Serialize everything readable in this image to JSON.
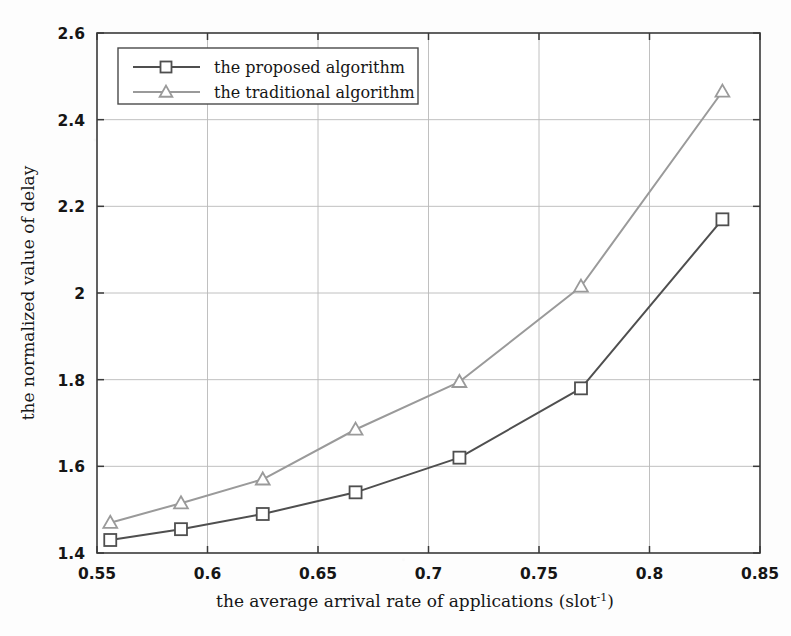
{
  "chart_data": {
    "type": "line",
    "title": "",
    "xlabel": "the average arrival rate of applications (slot⁻¹)",
    "xlabel_base": "the average arrival rate of applications (slot",
    "xlabel_exponent": "-1",
    "xlabel_tail": ")",
    "ylabel": "the normalized value of delay",
    "xlim": [
      0.55,
      0.85
    ],
    "ylim": [
      1.4,
      2.6
    ],
    "xticks": [
      0.55,
      0.6,
      0.65,
      0.7,
      0.75,
      0.8,
      0.85
    ],
    "xtick_labels": [
      "0.55",
      "0.6",
      "0.65",
      "0.7",
      "0.75",
      "0.8",
      "0.85"
    ],
    "yticks": [
      1.4,
      1.6,
      1.8,
      2.0,
      2.2,
      2.4,
      2.6
    ],
    "ytick_labels": [
      "1.4",
      "1.6",
      "1.8",
      "2",
      "2.2",
      "2.4",
      "2.6"
    ],
    "grid": true,
    "legend_position": "upper left",
    "x": [
      0.556,
      0.588,
      0.625,
      0.667,
      0.714,
      0.769,
      0.833
    ],
    "series": [
      {
        "name": "the proposed algorithm",
        "marker": "square",
        "color": "#4f4f4f",
        "values": [
          1.43,
          1.455,
          1.49,
          1.54,
          1.62,
          1.78,
          2.17
        ]
      },
      {
        "name": "the traditional algorithm",
        "marker": "triangle",
        "color": "#9a9a9a",
        "values": [
          1.47,
          1.515,
          1.57,
          1.685,
          1.795,
          2.015,
          2.465
        ]
      }
    ]
  },
  "legend": {
    "entries": [
      {
        "label": "the proposed algorithm",
        "marker": "square-marker",
        "color": "#4f4f4f"
      },
      {
        "label": "the traditional algorithm",
        "marker": "triangle-marker",
        "color": "#9a9a9a"
      }
    ]
  },
  "colors": {
    "proposed": "#4f4f4f",
    "traditional": "#9a9a9a",
    "grid": "#b9b9b9",
    "axis": "#3a3a3a",
    "background": "#fdfdfd",
    "text": "#161616"
  }
}
